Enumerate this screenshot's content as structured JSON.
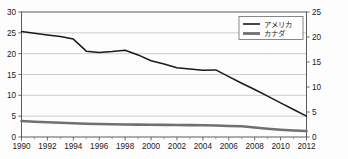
{
  "chart_data": {
    "type": "line",
    "title": "",
    "xlabel": "",
    "ylabel": "",
    "grid": true,
    "legend_position": "top-right",
    "x": [
      1990,
      1991,
      1992,
      1993,
      1994,
      1995,
      1996,
      1997,
      1998,
      1999,
      2000,
      2001,
      2002,
      2003,
      2004,
      2005,
      2006,
      2007,
      2008,
      2009,
      2010,
      2011,
      2012
    ],
    "xtick_labels": [
      "1990",
      "1992",
      "1994",
      "1996",
      "1998",
      "2000",
      "2002",
      "2004",
      "2006",
      "2008",
      "2010",
      "2012"
    ],
    "xtick_values": [
      1990,
      1992,
      1994,
      1996,
      1998,
      2000,
      2002,
      2004,
      2006,
      2008,
      2010,
      2012
    ],
    "xlim": [
      1990,
      2012
    ],
    "left_axis": {
      "label": "",
      "ylim": [
        0,
        30
      ],
      "ytick_labels": [
        "0",
        "5",
        "10",
        "15",
        "20",
        "25",
        "30"
      ],
      "ytick_values": [
        0,
        5,
        10,
        15,
        20,
        25,
        30
      ]
    },
    "right_axis": {
      "label": "",
      "ylim": [
        0,
        25
      ],
      "ytick_labels": [
        "0",
        "5",
        "10",
        "15",
        "20",
        "25"
      ],
      "ytick_values": [
        0,
        5,
        10,
        15,
        20,
        25
      ]
    },
    "series": [
      {
        "name": "アメリカ",
        "axis": "left",
        "color": "#1a1a1a",
        "width": 1.5,
        "values": [
          25.3,
          24.9,
          24.5,
          24.1,
          23.5,
          20.6,
          20.3,
          20.5,
          20.8,
          19.7,
          18.3,
          17.5,
          16.6,
          16.3,
          16.0,
          16.1,
          14.5,
          12.9,
          11.4,
          9.8,
          8.2,
          6.6,
          5.0
        ]
      },
      {
        "name": "カナダ",
        "axis": "right",
        "color": "#707070",
        "width": 2.6,
        "values": [
          3.2,
          3.05,
          2.95,
          2.85,
          2.75,
          2.65,
          2.6,
          2.55,
          2.5,
          2.48,
          2.45,
          2.42,
          2.4,
          2.38,
          2.35,
          2.3,
          2.2,
          2.15,
          1.9,
          1.65,
          1.45,
          1.3,
          1.2
        ]
      }
    ]
  },
  "legend": {
    "items": [
      {
        "label": "アメリカ",
        "color": "#1a1a1a",
        "width": 1.6
      },
      {
        "label": "カナダ",
        "color": "#707070",
        "width": 2.8
      }
    ]
  }
}
